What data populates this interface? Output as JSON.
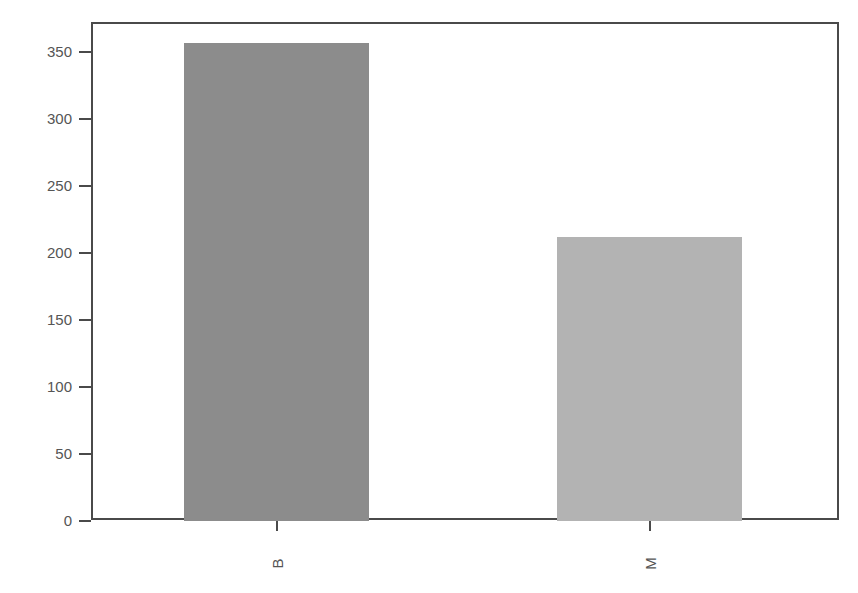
{
  "chart_data": {
    "type": "bar",
    "title": "",
    "xlabel": "",
    "ylabel": "",
    "categories": [
      "B",
      "M"
    ],
    "values": [
      357,
      212
    ],
    "colors": [
      "#8c8c8c",
      "#b3b3b3"
    ],
    "ylim": [
      0,
      370
    ],
    "yticks": [
      0,
      50,
      100,
      150,
      200,
      250,
      300,
      350
    ],
    "ytick_labels": [
      "0",
      "50",
      "100",
      "150",
      "200",
      "250",
      "300",
      "350"
    ],
    "xtick_rotation": 90,
    "grid": false,
    "legend": null
  }
}
